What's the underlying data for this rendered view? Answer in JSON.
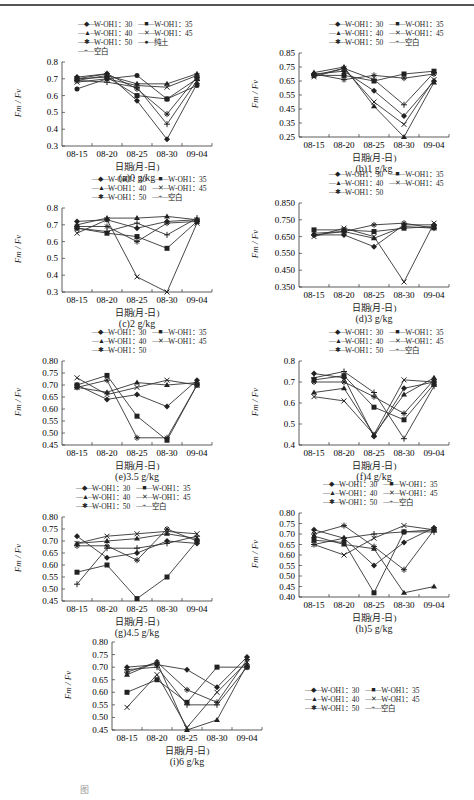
{
  "figure": {
    "ylabel": "Fm / Fv",
    "xlabel": "日期(月-日)",
    "figure_caption_partial": "图"
  },
  "chart_data": [
    {
      "id": "a",
      "type": "line",
      "title": "(a)0 g/kg",
      "xlabel": "日期(月-日)",
      "ylabel": "Fm/Fv",
      "categories": [
        "08-15",
        "08-20",
        "08-25",
        "08-30",
        "09-04"
      ],
      "ylim": [
        0.3,
        0.8
      ],
      "yticks": [
        "0.8",
        "0.7",
        "0.6",
        "0.5",
        "0.4",
        "0.3"
      ],
      "legend": [
        "W-OH1：30",
        "W-OH1：35",
        "W-OH1：40",
        "W-OH1：45",
        "W-OH1：50",
        "纯土",
        "空白"
      ],
      "series": [
        {
          "name": "W-OH1：30",
          "values": [
            0.71,
            0.73,
            0.57,
            0.34,
            0.67
          ]
        },
        {
          "name": "W-OH1：35",
          "values": [
            0.7,
            0.71,
            0.6,
            0.58,
            0.7
          ]
        },
        {
          "name": "W-OH1：40",
          "values": [
            0.69,
            0.72,
            0.67,
            0.67,
            0.73
          ]
        },
        {
          "name": "W-OH1：45",
          "values": [
            0.68,
            0.7,
            0.66,
            0.65,
            0.72
          ]
        },
        {
          "name": "W-OH1：50",
          "values": [
            0.7,
            0.73,
            0.64,
            0.49,
            0.71
          ]
        },
        {
          "name": "纯土",
          "values": [
            0.64,
            0.7,
            0.72,
            0.58,
            0.66
          ]
        },
        {
          "name": "空白",
          "values": [
            0.69,
            0.68,
            0.65,
            0.43,
            0.69
          ]
        }
      ]
    },
    {
      "id": "b",
      "type": "line",
      "title": "(b)1 g/kg",
      "categories": [
        "08-15",
        "08-20",
        "08-25",
        "08-30",
        "09-04"
      ],
      "ylim": [
        0.25,
        0.85
      ],
      "yticks": [
        "0.85",
        "0.75",
        "0.65",
        "0.55",
        "0.45",
        "0.35",
        "0.25"
      ],
      "legend": [
        "W-OH1：30",
        "W-OH1：35",
        "W-OH1：40",
        "W-OH1：45",
        "W-OH1：50",
        "空白"
      ],
      "series": [
        {
          "name": "W-OH1：30",
          "values": [
            0.7,
            0.72,
            0.58,
            0.4,
            0.65
          ]
        },
        {
          "name": "W-OH1：35",
          "values": [
            0.69,
            0.69,
            0.65,
            0.7,
            0.72
          ]
        },
        {
          "name": "W-OH1：40",
          "values": [
            0.71,
            0.75,
            0.47,
            0.25,
            0.64
          ]
        },
        {
          "name": "W-OH1：45",
          "values": [
            0.68,
            0.74,
            0.5,
            0.34,
            0.66
          ]
        },
        {
          "name": "W-OH1：50",
          "values": [
            0.7,
            0.66,
            0.69,
            0.67,
            0.7
          ]
        },
        {
          "name": "空白",
          "values": [
            0.69,
            0.74,
            0.66,
            0.48,
            0.71
          ]
        }
      ]
    },
    {
      "id": "c",
      "type": "line",
      "title": "(c)2 g/kg",
      "categories": [
        "08-15",
        "08-20",
        "08-25",
        "08-30",
        "09-04"
      ],
      "ylim": [
        0.3,
        0.8
      ],
      "yticks": [
        "0.8",
        "0.7",
        "0.6",
        "0.5",
        "0.4",
        "0.3"
      ],
      "legend": [
        "W-OH1：30",
        "W-OH1：35",
        "W-OH1：40",
        "W-OH1：45",
        "W-OH1：50",
        "空白"
      ],
      "series": [
        {
          "name": "W-OH1：30",
          "values": [
            0.72,
            0.73,
            0.68,
            0.72,
            0.73
          ]
        },
        {
          "name": "W-OH1：35",
          "values": [
            0.68,
            0.65,
            0.63,
            0.56,
            0.72
          ]
        },
        {
          "name": "W-OH1：40",
          "values": [
            0.7,
            0.74,
            0.74,
            0.75,
            0.73
          ]
        },
        {
          "name": "W-OH1：45",
          "values": [
            0.65,
            0.73,
            0.39,
            0.3,
            0.71
          ]
        },
        {
          "name": "W-OH1：50",
          "values": [
            0.69,
            0.69,
            0.6,
            0.71,
            0.72
          ]
        },
        {
          "name": "空白",
          "values": [
            0.68,
            0.66,
            0.71,
            0.64,
            0.74
          ]
        }
      ]
    },
    {
      "id": "d",
      "type": "line",
      "title": "(d)3 g/kg",
      "categories": [
        "08-15",
        "08-20",
        "08-25",
        "08-30",
        "09-04"
      ],
      "ylim": [
        0.35,
        0.85
      ],
      "yticks": [
        "0.850",
        "0.750",
        "0.650",
        "0.550",
        "0.450",
        "0.350"
      ],
      "legend": [
        "W-OH1：30",
        "W-OH1：35",
        "W-OH1：40",
        "W-OH1：45",
        "W-OH1：50"
      ],
      "series": [
        {
          "name": "W-OH1：30",
          "values": [
            0.66,
            0.66,
            0.59,
            0.72,
            0.72
          ]
        },
        {
          "name": "W-OH1：35",
          "values": [
            0.69,
            0.69,
            0.68,
            0.7,
            0.71
          ]
        },
        {
          "name": "W-OH1：40",
          "values": [
            0.67,
            0.68,
            0.64,
            0.71,
            0.7
          ]
        },
        {
          "name": "W-OH1：45",
          "values": [
            0.65,
            0.7,
            0.65,
            0.38,
            0.73
          ]
        },
        {
          "name": "W-OH1：50",
          "values": [
            0.66,
            0.68,
            0.72,
            0.73,
            0.7
          ]
        }
      ]
    },
    {
      "id": "e",
      "type": "line",
      "title": "(e)3.5 g/kg",
      "categories": [
        "08-15",
        "08-20",
        "08-25",
        "08-30",
        "09-04"
      ],
      "ylim": [
        0.45,
        0.8
      ],
      "yticks": [
        "0.80",
        "0.75",
        "0.70",
        "0.65",
        "0.60",
        "0.55",
        "0.50",
        "0.45"
      ],
      "legend": [
        "W-OH1：30",
        "W-OH1：35",
        "W-OH1：40",
        "W-OH1：45",
        "W-OH1：50"
      ],
      "series": [
        {
          "name": "W-OH1：30",
          "values": [
            0.7,
            0.64,
            0.66,
            0.61,
            0.72
          ]
        },
        {
          "name": "W-OH1：35",
          "values": [
            0.7,
            0.74,
            0.57,
            0.47,
            0.7
          ]
        },
        {
          "name": "W-OH1：40",
          "values": [
            0.69,
            0.67,
            0.71,
            0.7,
            0.71
          ]
        },
        {
          "name": "W-OH1：45",
          "values": [
            0.73,
            0.66,
            0.69,
            0.72,
            0.7
          ]
        },
        {
          "name": "W-OH1：50",
          "values": [
            0.69,
            0.72,
            0.48,
            0.48,
            0.7
          ]
        }
      ]
    },
    {
      "id": "f",
      "type": "line",
      "title": "(f)4 g/kg",
      "categories": [
        "08-15",
        "08-20",
        "08-25",
        "08-30",
        "09-04"
      ],
      "ylim": [
        0.4,
        0.8
      ],
      "yticks": [
        "0.8",
        "0.7",
        "0.6",
        "0.5",
        "0.4"
      ],
      "legend": [
        "W-OH1：30",
        "W-OH1：35",
        "W-OH1：40",
        "W-OH1：45",
        "W-OH1：50",
        "空白"
      ],
      "series": [
        {
          "name": "W-OH1：30",
          "values": [
            0.74,
            0.72,
            0.44,
            0.67,
            0.7
          ]
        },
        {
          "name": "W-OH1：35",
          "values": [
            0.71,
            0.73,
            0.58,
            0.52,
            0.69
          ]
        },
        {
          "name": "W-OH1：40",
          "values": [
            0.65,
            0.67,
            0.45,
            0.64,
            0.72
          ]
        },
        {
          "name": "W-OH1：45",
          "values": [
            0.63,
            0.61,
            0.45,
            0.71,
            0.7
          ]
        },
        {
          "name": "W-OH1：50",
          "values": [
            0.7,
            0.7,
            0.63,
            0.55,
            0.71
          ]
        },
        {
          "name": "空白",
          "values": [
            0.72,
            0.75,
            0.65,
            0.43,
            0.68
          ]
        }
      ]
    },
    {
      "id": "g",
      "type": "line",
      "title": "(g)4.5 g/kg",
      "categories": [
        "08-15",
        "08-20",
        "08-25",
        "08-30",
        "09-04"
      ],
      "ylim": [
        0.45,
        0.8
      ],
      "yticks": [
        "0.80",
        "0.75",
        "0.70",
        "0.65",
        "0.60",
        "0.55",
        "0.50",
        "0.45"
      ],
      "legend": [
        "W-OH1：30",
        "W-OH1：35",
        "W-OH1：40",
        "W-OH1：45",
        "W-OH1：50",
        "空白"
      ],
      "series": [
        {
          "name": "W-OH1：30",
          "values": [
            0.72,
            0.63,
            0.65,
            0.7,
            0.69
          ]
        },
        {
          "name": "W-OH1：35",
          "values": [
            0.57,
            0.6,
            0.46,
            0.55,
            0.7
          ]
        },
        {
          "name": "W-OH1：40",
          "values": [
            0.69,
            0.7,
            0.71,
            0.73,
            0.71
          ]
        },
        {
          "name": "W-OH1：45",
          "values": [
            0.69,
            0.72,
            0.73,
            0.74,
            0.73
          ]
        },
        {
          "name": "W-OH1：50",
          "values": [
            0.68,
            0.68,
            0.62,
            0.75,
            0.7
          ]
        },
        {
          "name": "空白",
          "values": [
            0.52,
            0.67,
            0.67,
            0.69,
            0.72
          ]
        }
      ]
    },
    {
      "id": "h",
      "type": "line",
      "title": "(h)5 g/kg",
      "categories": [
        "08-15",
        "08-20",
        "08-25",
        "08-30",
        "09-04"
      ],
      "ylim": [
        0.4,
        0.8
      ],
      "yticks": [
        "0.80",
        "0.75",
        "0.70",
        "0.65",
        "0.60",
        "0.55",
        "0.50",
        "0.45",
        "0.40"
      ],
      "legend": [
        "W-OH1：30",
        "W-OH1：35",
        "W-OH1：40",
        "W-OH1：45",
        "W-OH1：50",
        "空白"
      ],
      "series": [
        {
          "name": "W-OH1：30",
          "values": [
            0.72,
            0.68,
            0.55,
            0.66,
            0.73
          ]
        },
        {
          "name": "W-OH1：35",
          "values": [
            0.67,
            0.66,
            0.42,
            0.71,
            0.72
          ]
        },
        {
          "name": "W-OH1：40",
          "values": [
            0.69,
            0.65,
            0.63,
            0.42,
            0.45
          ]
        },
        {
          "name": "W-OH1：45",
          "values": [
            0.65,
            0.6,
            0.68,
            0.74,
            0.72
          ]
        },
        {
          "name": "W-OH1：50",
          "values": [
            0.7,
            0.74,
            0.64,
            0.53,
            0.72
          ]
        },
        {
          "name": "空白",
          "values": [
            0.65,
            0.68,
            0.7,
            0.71,
            0.71
          ]
        }
      ]
    },
    {
      "id": "i",
      "type": "line",
      "title": "(i)6 g/kg",
      "categories": [
        "08-15",
        "08-20",
        "08-25",
        "08-30",
        "09-04"
      ],
      "ylim": [
        0.45,
        0.8
      ],
      "yticks": [
        "0.80",
        "0.75",
        "0.70",
        "0.65",
        "0.60",
        "0.55",
        "0.50",
        "0.45"
      ],
      "legend": [
        "W-OH1：30",
        "W-OH1：35",
        "W-OH1：40",
        "W-OH1：45",
        "W-OH1：50",
        "空白"
      ],
      "series": [
        {
          "name": "W-OH1：30",
          "values": [
            0.7,
            0.71,
            0.69,
            0.62,
            0.74
          ]
        },
        {
          "name": "W-OH1：35",
          "values": [
            0.6,
            0.65,
            0.56,
            0.7,
            0.7
          ]
        },
        {
          "name": "W-OH1：40",
          "values": [
            0.67,
            0.72,
            0.45,
            0.49,
            0.71
          ]
        },
        {
          "name": "W-OH1：45",
          "values": [
            0.54,
            0.67,
            0.46,
            0.6,
            0.72
          ]
        },
        {
          "name": "W-OH1：50",
          "values": [
            0.68,
            0.72,
            0.61,
            0.56,
            0.73
          ]
        },
        {
          "name": "空白",
          "values": [
            0.69,
            0.7,
            0.55,
            0.55,
            0.7
          ]
        }
      ]
    }
  ],
  "layout": {
    "panels": [
      {
        "id": "a",
        "left": 10,
        "top": 20,
        "legendLeft": 68,
        "legendTop": 0
      },
      {
        "id": "b",
        "left": 247,
        "top": 20,
        "legendLeft": 82,
        "legendTop": 0
      },
      {
        "id": "c",
        "left": 10,
        "top": 175,
        "legendLeft": 82,
        "legendTop": 0
      },
      {
        "id": "d",
        "left": 247,
        "top": 170,
        "legendLeft": 82,
        "legendTop": 0
      },
      {
        "id": "e",
        "left": 10,
        "top": 328,
        "legendLeft": 82,
        "legendTop": 0
      },
      {
        "id": "f",
        "left": 247,
        "top": 328,
        "legendLeft": 82,
        "legendTop": 0
      },
      {
        "id": "g",
        "left": 10,
        "top": 484,
        "legendLeft": 66,
        "legendTop": 0
      },
      {
        "id": "h",
        "left": 247,
        "top": 480,
        "legendLeft": 76,
        "legendTop": 0
      },
      {
        "id": "i",
        "left": 60,
        "top": 636,
        "legendLeft": 245,
        "legendTop": 50
      }
    ],
    "markers": [
      "◆",
      "■",
      "▲",
      "✕",
      "✱",
      "●",
      "+"
    ]
  }
}
